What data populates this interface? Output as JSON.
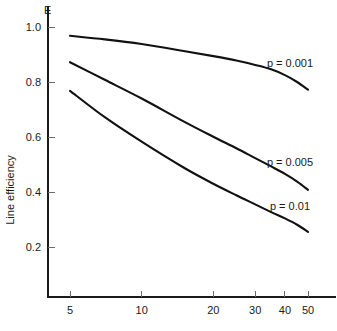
{
  "chart_data": {
    "type": "line",
    "title": "",
    "subtitle": "",
    "xlabel": "",
    "ylabel": "Line efficiency",
    "y_axis_symbol": "E",
    "xscale": "log",
    "yscale": "linear",
    "xlim": [
      4.2,
      58
    ],
    "ylim": [
      0.0,
      1.06
    ],
    "grid": false,
    "legend_position": "inline-right-of-curve",
    "x_ticks": [
      5,
      10,
      20,
      30,
      40,
      50
    ],
    "x_tick_labels": [
      "5",
      "10",
      "20",
      "30",
      "40",
      "50"
    ],
    "y_ticks": [
      0.2,
      0.4,
      0.6,
      0.8,
      1.0
    ],
    "y_tick_labels": [
      "0.2",
      "0.4",
      "0.6",
      "0.8",
      "1.0"
    ],
    "x": [
      5,
      7,
      10,
      15,
      20,
      25,
      30,
      35,
      40,
      45,
      50
    ],
    "series": [
      {
        "name": "p = 0.001",
        "label": "p = 0.001",
        "color": "#111111",
        "values": [
          0.968,
          0.955,
          0.938,
          0.913,
          0.894,
          0.878,
          0.862,
          0.846,
          0.825,
          0.8,
          0.772
        ],
        "label_x": 42,
        "label_y": 0.855
      },
      {
        "name": "p = 0.005",
        "label": "p = 0.005",
        "color": "#111111",
        "values": [
          0.872,
          0.808,
          0.74,
          0.657,
          0.601,
          0.559,
          0.523,
          0.493,
          0.466,
          0.438,
          0.408
        ],
        "label_x": 42,
        "label_y": 0.495
      },
      {
        "name": "p = 0.01",
        "label": "p = 0.01",
        "color": "#111111",
        "values": [
          0.768,
          0.672,
          0.583,
          0.489,
          0.43,
          0.388,
          0.355,
          0.327,
          0.304,
          0.281,
          0.255
        ],
        "label_x": 42,
        "label_y": 0.335
      }
    ]
  }
}
